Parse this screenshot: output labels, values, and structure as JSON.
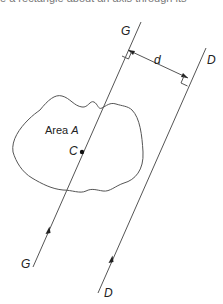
{
  "caption": "e a rectangle about an axis through its",
  "diagram": {
    "type": "parallel-axis-theorem",
    "area_label": "Area ",
    "area_symbol": "A",
    "centroid_label": "C",
    "axis_g": {
      "label_top": "G",
      "label_bottom": "G"
    },
    "axis_d": {
      "label_top": "D",
      "label_bottom": "D"
    },
    "distance_label": "d",
    "colors": {
      "stroke": "#555555",
      "text": "#222222"
    }
  }
}
